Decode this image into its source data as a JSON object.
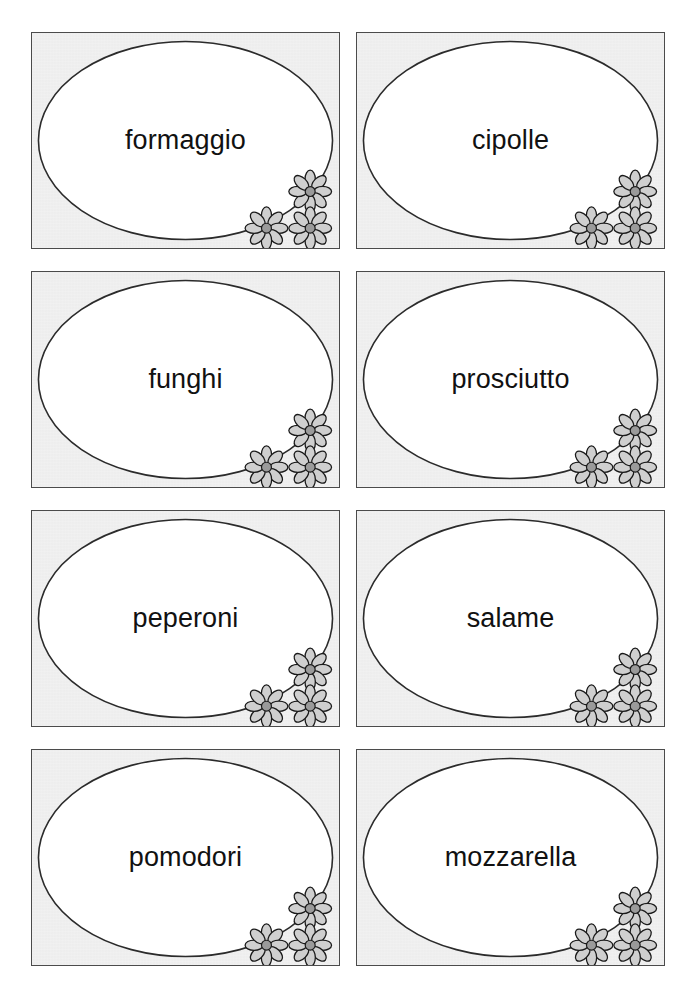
{
  "page": {
    "background_color": "#ffffff",
    "width": 682,
    "height": 994,
    "columns": 2,
    "rows": 4
  },
  "style": {
    "card_fill": "#e7e7e7",
    "card_border_color": "#4b4b4b",
    "ellipse_fill": "#ffffff",
    "ellipse_stroke": "#2b2b2b",
    "flower_petal_fill": "#cfcfcf",
    "flower_center_fill": "#9a9a9a",
    "flower_stroke": "#1a1a1a",
    "text_color": "#111111"
  },
  "cards": [
    {
      "label": "formaggio",
      "row": 1,
      "column": 1,
      "decoration": "three-daisies-bottom-right"
    },
    {
      "label": "cipolle",
      "row": 1,
      "column": 2,
      "decoration": "three-daisies-bottom-right"
    },
    {
      "label": "funghi",
      "row": 2,
      "column": 1,
      "decoration": "three-daisies-bottom-right"
    },
    {
      "label": "prosciutto",
      "row": 2,
      "column": 2,
      "decoration": "three-daisies-bottom-right"
    },
    {
      "label": "peperoni",
      "row": 3,
      "column": 1,
      "decoration": "three-daisies-bottom-right"
    },
    {
      "label": "salame",
      "row": 3,
      "column": 2,
      "decoration": "three-daisies-bottom-right"
    },
    {
      "label": "pomodori",
      "row": 4,
      "column": 1,
      "decoration": "three-daisies-bottom-right"
    },
    {
      "label": "mozzarella",
      "row": 4,
      "column": 2,
      "decoration": "three-daisies-bottom-right"
    }
  ]
}
